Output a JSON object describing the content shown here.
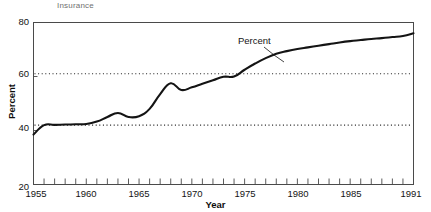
{
  "figure": {
    "caption": "Insurance",
    "caption_color": "#6f6f6f"
  },
  "axes": {
    "x_title": "Year",
    "y_title": "Percent",
    "y_ticks": [
      "20",
      "40",
      "60",
      "80"
    ],
    "x_ticks": [
      "1955",
      "1960",
      "1965",
      "1970",
      "1975",
      "1980",
      "1985",
      "1991"
    ],
    "frame_color": "#4a4a4a"
  },
  "annotations": {
    "series_label": "Percent"
  },
  "chart_data": {
    "type": "line",
    "title": "Insurance",
    "xlabel": "Year",
    "ylabel": "Percent",
    "xlim": [
      1955,
      1991
    ],
    "ylim": [
      20,
      80
    ],
    "grid": "dotted-horizontal-reference-lines",
    "legend": "inline-annotation",
    "reference_lines": [
      42,
      61
    ],
    "series": [
      {
        "name": "Percent",
        "line_color": "#141414",
        "line_width": 2.1,
        "x": [
          1955,
          1956,
          1957,
          1958,
          1959,
          1960,
          1961,
          1962,
          1963,
          1964,
          1965,
          1966,
          1967,
          1968,
          1969,
          1970,
          1971,
          1972,
          1973,
          1974,
          1975,
          1976,
          1977,
          1978,
          1979,
          1980,
          1981,
          1982,
          1983,
          1984,
          1985,
          1986,
          1987,
          1988,
          1989,
          1990,
          1991
        ],
        "values": [
          38.5,
          42.0,
          42.1,
          42.2,
          42.3,
          42.4,
          43.3,
          45.0,
          46.5,
          45.0,
          45.3,
          48.0,
          53.5,
          57.5,
          55.0,
          56.0,
          57.3,
          58.6,
          59.9,
          60.0,
          62.5,
          64.8,
          66.8,
          68.4,
          69.4,
          70.2,
          70.8,
          71.4,
          72.0,
          72.6,
          73.1,
          73.5,
          73.9,
          74.2,
          74.6,
          75.0,
          76.0
        ]
      }
    ]
  }
}
